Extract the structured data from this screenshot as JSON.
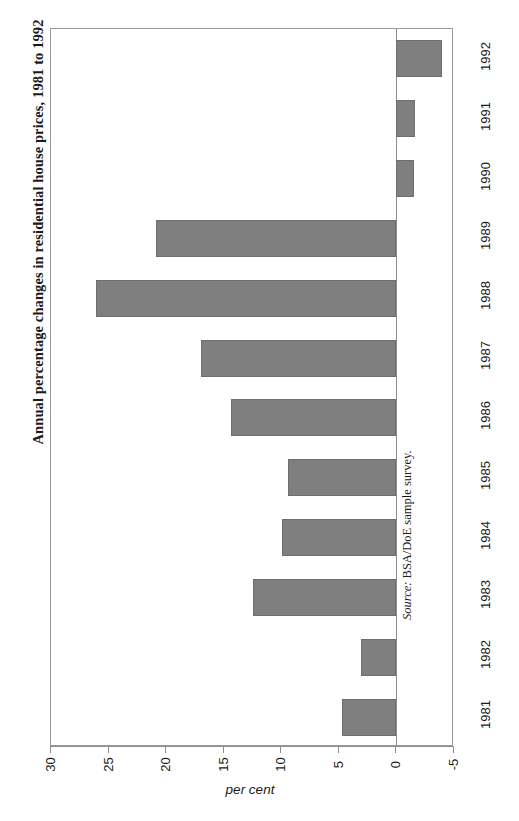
{
  "chart_data": {
    "type": "bar",
    "orientation": "horizontal-rotated",
    "title": "Annual percentage changes in residential house prices, 1981 to 1992",
    "xlabel": "",
    "ylabel": "per cent",
    "value_axis_title": "per cent",
    "categories": [
      "1981",
      "1982",
      "1983",
      "1984",
      "1985",
      "1986",
      "1987",
      "1988",
      "1989",
      "1990",
      "1991",
      "1992"
    ],
    "values": [
      4.7,
      3.1,
      12.5,
      9.9,
      9.4,
      14.4,
      17.0,
      26.1,
      20.9,
      -1.5,
      -1.6,
      -4.0
    ],
    "series": [
      {
        "name": "Annual percentage change",
        "values": [
          4.7,
          3.1,
          12.5,
          9.9,
          9.4,
          14.4,
          17.0,
          26.1,
          20.9,
          -1.5,
          -1.6,
          -4.0
        ]
      }
    ],
    "value_ticks": [
      "30",
      "25",
      "20",
      "15",
      "10",
      "5",
      "0",
      "-5"
    ],
    "value_tick_numbers": [
      30,
      25,
      20,
      15,
      10,
      5,
      0,
      -5
    ],
    "vlim": [
      30,
      -5
    ],
    "grid": false,
    "legend": false,
    "bar_color": "#7f7f7f",
    "axis_color": "#8c8c8c"
  },
  "source": {
    "label": "Source:",
    "text": "BSA/DoE sample survey."
  }
}
